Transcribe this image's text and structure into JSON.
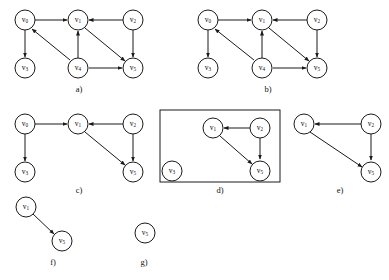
{
  "figure": {
    "title": "",
    "background_color": "#ffffff",
    "stroke_color": "#1a1a1a",
    "width": 389,
    "height": 280
  },
  "node_labels": {
    "v0": "v",
    "v0_sub": "0",
    "v1": "v",
    "v1_sub": "1",
    "v2": "v",
    "v2_sub": "2",
    "v3": "v",
    "v3_sub": "3",
    "v4": "v",
    "v4_sub": "4",
    "v5": "v",
    "v5_sub": "5"
  },
  "panels": [
    {
      "id": "a",
      "caption": "a)",
      "framed": false,
      "nodes": [
        "v0",
        "v1",
        "v2",
        "v3",
        "v4",
        "v5"
      ],
      "edges": [
        {
          "from": "v0",
          "to": "v1"
        },
        {
          "from": "v0",
          "to": "v3"
        },
        {
          "from": "v2",
          "to": "v1"
        },
        {
          "from": "v2",
          "to": "v5"
        },
        {
          "from": "v1",
          "to": "v5"
        },
        {
          "from": "v4",
          "to": "v1"
        },
        {
          "from": "v4",
          "to": "v5"
        },
        {
          "from": "v4",
          "to": "v0"
        }
      ]
    },
    {
      "id": "b",
      "caption": "b)",
      "framed": false,
      "nodes": [
        "v0",
        "v1",
        "v2",
        "v3",
        "v4",
        "v5"
      ],
      "edges": [
        {
          "from": "v0",
          "to": "v1"
        },
        {
          "from": "v0",
          "to": "v3"
        },
        {
          "from": "v2",
          "to": "v1"
        },
        {
          "from": "v2",
          "to": "v5"
        },
        {
          "from": "v1",
          "to": "v5"
        },
        {
          "from": "v4",
          "to": "v1"
        },
        {
          "from": "v4",
          "to": "v5"
        },
        {
          "from": "v4",
          "to": "v0"
        }
      ]
    },
    {
      "id": "c",
      "caption": "c)",
      "framed": false,
      "nodes": [
        "v0",
        "v1",
        "v2",
        "v3",
        "v5"
      ],
      "edges": [
        {
          "from": "v0",
          "to": "v1"
        },
        {
          "from": "v0",
          "to": "v3"
        },
        {
          "from": "v2",
          "to": "v1"
        },
        {
          "from": "v2",
          "to": "v5"
        },
        {
          "from": "v1",
          "to": "v5"
        }
      ]
    },
    {
      "id": "d",
      "caption": "d)",
      "framed": true,
      "nodes": [
        "v1",
        "v2",
        "v3",
        "v5"
      ],
      "edges": [
        {
          "from": "v2",
          "to": "v1"
        },
        {
          "from": "v2",
          "to": "v5"
        },
        {
          "from": "v1",
          "to": "v5"
        }
      ]
    },
    {
      "id": "e",
      "caption": "e)",
      "framed": false,
      "nodes": [
        "v1",
        "v2",
        "v5"
      ],
      "edges": [
        {
          "from": "v2",
          "to": "v1"
        },
        {
          "from": "v2",
          "to": "v5"
        },
        {
          "from": "v1",
          "to": "v5"
        }
      ]
    },
    {
      "id": "f",
      "caption": "f)",
      "framed": false,
      "nodes": [
        "v1",
        "v5"
      ],
      "edges": [
        {
          "from": "v1",
          "to": "v5"
        }
      ]
    },
    {
      "id": "g",
      "caption": "g)",
      "framed": false,
      "nodes": [
        "v5"
      ],
      "edges": []
    }
  ]
}
